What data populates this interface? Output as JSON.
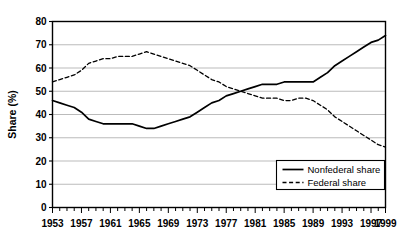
{
  "chart_data": {
    "type": "line",
    "title": "",
    "xlabel": "",
    "ylabel": "Share (%)",
    "xlim": [
      1953,
      1999
    ],
    "ylim": [
      0,
      80
    ],
    "ytick_step": 10,
    "yticks": [
      "0",
      "10",
      "20",
      "30",
      "40",
      "50",
      "60",
      "70",
      "80"
    ],
    "xticks_labeled": [
      "1953",
      "1957",
      "1961",
      "1965",
      "1969",
      "1973",
      "1977",
      "1981",
      "1985",
      "1989",
      "1993",
      "1997",
      "1999"
    ],
    "xtick_minor_every": 1,
    "grid": "horizontal",
    "legend_position": "bottom-right",
    "x": [
      1953,
      1954,
      1955,
      1956,
      1957,
      1958,
      1959,
      1960,
      1961,
      1962,
      1963,
      1964,
      1965,
      1966,
      1967,
      1968,
      1969,
      1970,
      1971,
      1972,
      1973,
      1974,
      1975,
      1976,
      1977,
      1978,
      1979,
      1980,
      1981,
      1982,
      1983,
      1984,
      1985,
      1986,
      1987,
      1988,
      1989,
      1990,
      1991,
      1992,
      1993,
      1994,
      1995,
      1996,
      1997,
      1998,
      1999
    ],
    "series": [
      {
        "name": "Nonfederal share",
        "style": "solid",
        "color": "#000000",
        "values": [
          46,
          45,
          44,
          43,
          41,
          38,
          37,
          36,
          36,
          36,
          36,
          36,
          35,
          34,
          34,
          35,
          36,
          37,
          38,
          39,
          41,
          43,
          45,
          46,
          48,
          49,
          50,
          51,
          52,
          53,
          53,
          53,
          54,
          54,
          54,
          54,
          54,
          56,
          58,
          61,
          63,
          65,
          67,
          69,
          71,
          72,
          74
        ]
      },
      {
        "name": "Federal share",
        "style": "dashed",
        "color": "#000000",
        "values": [
          54,
          55,
          56,
          57,
          59,
          62,
          63,
          64,
          64,
          65,
          65,
          65,
          66,
          67,
          66,
          65,
          64,
          63,
          62,
          61,
          59,
          57,
          55,
          54,
          52,
          51,
          50,
          49,
          48,
          47,
          47,
          47,
          46,
          46,
          47,
          47,
          46,
          44,
          42,
          39,
          37,
          35,
          33,
          31,
          29,
          27,
          26
        ]
      }
    ]
  },
  "legend": {
    "items": [
      {
        "label": "Nonfederal share",
        "style": "solid"
      },
      {
        "label": "Federal share",
        "style": "dashed"
      }
    ]
  },
  "colors": {
    "axis": "#000000",
    "grid": "#b3b3b3",
    "background": "#ffffff",
    "line": "#000000"
  }
}
